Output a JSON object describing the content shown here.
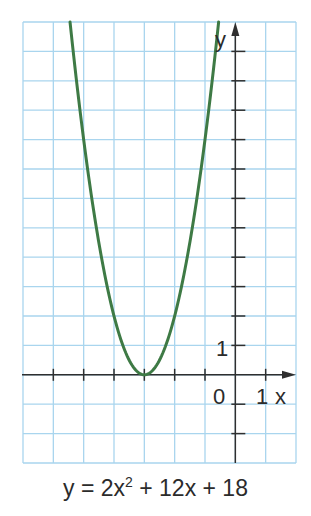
{
  "chart_data": {
    "type": "line",
    "equation": {
      "prefix": "y = 2x",
      "exponent": "2",
      "suffix": " + 12x + 18"
    },
    "xlabel": "x",
    "ylabel": "y",
    "xlim": [
      -7,
      2
    ],
    "ylim": [
      -3,
      12
    ],
    "grid": true,
    "tick_labels": {
      "origin": "0",
      "x_one": "1",
      "y_one": "1"
    },
    "vertex": [
      -3,
      0
    ],
    "series": [
      {
        "name": "y = 2x^2 + 12x + 18",
        "x": [
          -5.449,
          -5,
          -4.5,
          -4,
          -3.5,
          -3,
          -2.5,
          -2,
          -1.5,
          -1,
          -0.551
        ],
        "y": [
          12,
          8,
          4.5,
          2,
          0.5,
          0,
          0.5,
          2,
          4.5,
          8,
          12
        ]
      }
    ],
    "colors": {
      "curve": "#3e7a45",
      "grid": "#a9d5ee",
      "axis": "#2f2f2f"
    }
  }
}
